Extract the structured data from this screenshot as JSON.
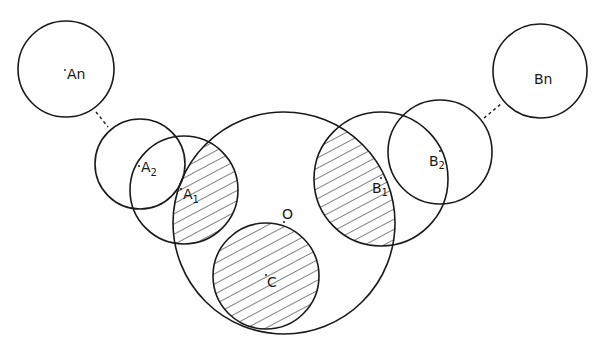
{
  "diagram": {
    "type": "circle-overlap",
    "stroke_color": "#1a1a1a",
    "background": "#ffffff",
    "hatch": "diagonal",
    "circles": [
      {
        "id": "An",
        "label": "An",
        "cx": 66,
        "cy": 69,
        "r": 48,
        "hatched": false
      },
      {
        "id": "A2",
        "label": "A",
        "sub": "2",
        "cx": 140,
        "cy": 164,
        "r": 45,
        "hatched": false
      },
      {
        "id": "A1",
        "label": "A",
        "sub": "1",
        "cx": 184,
        "cy": 190,
        "r": 54,
        "hatched": "intersection-with-O"
      },
      {
        "id": "O",
        "label": "O",
        "cx": 284,
        "cy": 223,
        "r": 111,
        "hatched": false
      },
      {
        "id": "C",
        "label": "C",
        "cx": 266,
        "cy": 276,
        "r": 53,
        "hatched": true
      },
      {
        "id": "B1",
        "label": "B",
        "sub": "1",
        "cx": 381,
        "cy": 179,
        "r": 67,
        "hatched": "intersection-with-O"
      },
      {
        "id": "B2",
        "label": "B",
        "sub": "2",
        "cx": 440,
        "cy": 152,
        "r": 52,
        "hatched": false
      },
      {
        "id": "Bn",
        "label": "Bn",
        "cx": 540,
        "cy": 71,
        "r": 47,
        "hatched": false
      }
    ],
    "dashed_connectors": [
      {
        "from": "An",
        "to": "A2"
      },
      {
        "from": "B2",
        "to": "Bn"
      }
    ]
  },
  "labels": {
    "An": "An",
    "A2": "A",
    "A2_sub": "2",
    "A1": "A",
    "A1_sub": "1",
    "O": "O",
    "C": "C",
    "B1": "B",
    "B1_sub": "1",
    "B2": "B",
    "B2_sub": "2",
    "Bn": "Bn"
  }
}
